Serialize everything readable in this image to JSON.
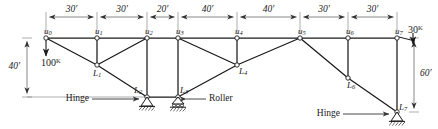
{
  "figure": {
    "type": "truss-structural-diagram",
    "units": "feet",
    "load_units": "kips"
  },
  "top_chord_nodes": [
    {
      "id": "u0",
      "label": "u",
      "sub": "0",
      "x": 46,
      "y": 38
    },
    {
      "id": "u1",
      "label": "u",
      "sub": "1",
      "x": 97,
      "y": 38
    },
    {
      "id": "u2",
      "label": "u",
      "sub": "2",
      "x": 147,
      "y": 38
    },
    {
      "id": "u3",
      "label": "u",
      "sub": "3",
      "x": 178,
      "y": 38
    },
    {
      "id": "u4",
      "label": "u",
      "sub": "4",
      "x": 237,
      "y": 38
    },
    {
      "id": "u5",
      "label": "u",
      "sub": "5",
      "x": 300,
      "y": 38
    },
    {
      "id": "u6",
      "label": "u",
      "sub": "6",
      "x": 348,
      "y": 38
    },
    {
      "id": "u7",
      "label": "u",
      "sub": "7",
      "x": 397,
      "y": 38
    }
  ],
  "bottom_chord_nodes": [
    {
      "id": "L1",
      "label": "L",
      "sub": "1",
      "x": 97,
      "y": 65
    },
    {
      "id": "L2",
      "label": "L",
      "sub": "2",
      "x": 147,
      "y": 97
    },
    {
      "id": "L3",
      "label": "L",
      "sub": "3",
      "x": 178,
      "y": 97
    },
    {
      "id": "L4",
      "label": "L",
      "sub": "4",
      "x": 237,
      "y": 65
    },
    {
      "id": "L6",
      "label": "L",
      "sub": "6",
      "x": 348,
      "y": 78
    },
    {
      "id": "L7",
      "label": "L",
      "sub": "7",
      "x": 397,
      "y": 112
    }
  ],
  "members": [
    [
      "u0",
      "u1"
    ],
    [
      "u1",
      "u2"
    ],
    [
      "u2",
      "u3"
    ],
    [
      "u3",
      "u4"
    ],
    [
      "u4",
      "u5"
    ],
    [
      "u5",
      "u6"
    ],
    [
      "u6",
      "u7"
    ],
    [
      "u0",
      "L1"
    ],
    [
      "u1",
      "L1"
    ],
    [
      "u2",
      "L1"
    ],
    [
      "L1",
      "L2"
    ],
    [
      "u2",
      "L2"
    ],
    [
      "u3",
      "L3"
    ],
    [
      "L2",
      "L3"
    ],
    [
      "u3",
      "L4"
    ],
    [
      "L3",
      "L4"
    ],
    [
      "u4",
      "L4"
    ],
    [
      "L4",
      "u5"
    ],
    [
      "u5",
      "L6"
    ],
    [
      "u6",
      "L6"
    ],
    [
      "L6",
      "L7"
    ],
    [
      "u7",
      "L7"
    ]
  ],
  "horizontal_dimensions": [
    {
      "label": "30'",
      "from": 46,
      "to": 97
    },
    {
      "label": "30'",
      "from": 97,
      "to": 147
    },
    {
      "label": "20'",
      "from": 147,
      "to": 178
    },
    {
      "label": "40'",
      "from": 178,
      "to": 237
    },
    {
      "label": "40'",
      "from": 237,
      "to": 300
    },
    {
      "label": "30'",
      "from": 300,
      "to": 348
    },
    {
      "label": "30'",
      "from": 348,
      "to": 397
    }
  ],
  "vertical_dimensions": [
    {
      "label": "40'",
      "x": 27,
      "from_y": 38,
      "to_y": 97
    },
    {
      "label": "60'",
      "x": 414,
      "from_y": 38,
      "to_y": 112
    }
  ],
  "loads": [
    {
      "id": "load-100k",
      "value": "100",
      "unit": "K",
      "at": "u0",
      "direction": "down"
    },
    {
      "id": "load-30k",
      "value": "30",
      "unit": "K",
      "at": "u7",
      "direction": "down-right"
    }
  ],
  "supports": [
    {
      "id": "support-L2",
      "type": "Hinge",
      "at": "L2",
      "label": "Hinge"
    },
    {
      "id": "support-L3",
      "type": "Roller",
      "at": "L3",
      "label": "Roller"
    },
    {
      "id": "support-L7",
      "type": "Hinge",
      "at": "L7",
      "label": "Hinge"
    }
  ],
  "support_callouts": [
    {
      "id": "callout-hinge-left",
      "text": "Hinge",
      "x": 89,
      "y": 99,
      "anchor": "end"
    },
    {
      "id": "callout-roller",
      "text": "Roller",
      "x": 209,
      "y": 99,
      "anchor": "start"
    },
    {
      "id": "callout-hinge-right",
      "text": "Hinge",
      "x": 340,
      "y": 114,
      "anchor": "end"
    }
  ],
  "colors": {
    "line": "#1a1a1a",
    "dimension": "#555555",
    "background": "#ffffff",
    "node_fill": "#ffffff"
  }
}
